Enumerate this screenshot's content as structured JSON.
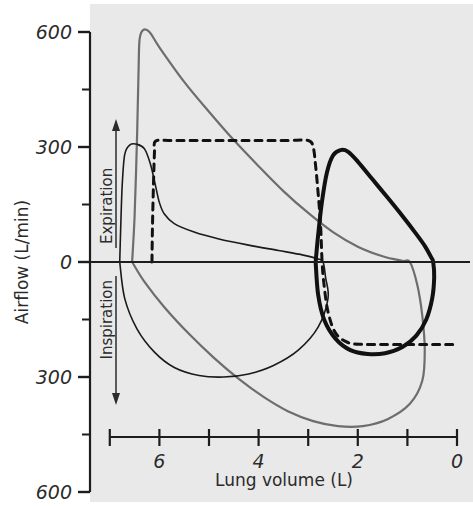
{
  "figure": {
    "background": "#ffffff",
    "plot_background": "#e9e9e9"
  },
  "axes": {
    "x_title": "Lung volume (L)",
    "y_title": "Airflow (L/min)",
    "x_ticks": [
      "7",
      "6",
      "5",
      "4",
      "3",
      "2",
      "1",
      "0"
    ],
    "x_tick_labels_shown": [
      "6",
      "4",
      "2",
      "0"
    ],
    "y_tick_labels_shown": [
      "600",
      "300",
      "0",
      "300",
      "600"
    ],
    "direction_up": "Expiration",
    "direction_down": "Inspiration"
  },
  "colors": {
    "maximal_loop": "#6d6d6d",
    "obstructed_loop": "#1a1a1a",
    "tidal_loop": "#111111",
    "dashed_loop": "#111111",
    "axis": "#1d1d1d"
  },
  "chart_data": {
    "type": "line",
    "title": "",
    "subtitle": "",
    "xlabel": "Lung volume (L)",
    "ylabel": "Airflow (L/min)",
    "xlim": [
      7,
      0
    ],
    "ylim": [
      -600,
      600
    ],
    "x_ticks": [
      7,
      6,
      5,
      4,
      3,
      2,
      1,
      0
    ],
    "y_ticks": [
      -600,
      -450,
      -300,
      -150,
      0,
      150,
      300,
      450,
      600
    ],
    "y_tick_labels": [
      "600",
      "",
      "300",
      "",
      "0",
      "",
      "300",
      "",
      "600"
    ],
    "grid": false,
    "legend": "none",
    "annotations": [
      {
        "text": "Expiration",
        "direction": "up",
        "axis": "y"
      },
      {
        "text": "Inspiration",
        "direction": "down",
        "axis": "y"
      }
    ],
    "note": "Flow-volume loops. X axis is reversed (lung volume decreases left to right).",
    "series": [
      {
        "name": "Maximal flow-volume loop (normal, grey)",
        "color": "#6d6d6d",
        "style": "solid",
        "width": 2.2,
        "points": [
          [
            6.55,
            0
          ],
          [
            6.5,
            120
          ],
          [
            6.45,
            330
          ],
          [
            6.42,
            500
          ],
          [
            6.4,
            580
          ],
          [
            6.33,
            605
          ],
          [
            6.2,
            600
          ],
          [
            6.0,
            560
          ],
          [
            5.5,
            470
          ],
          [
            5.0,
            392
          ],
          [
            4.5,
            318
          ],
          [
            4.0,
            250
          ],
          [
            3.5,
            185
          ],
          [
            3.0,
            128
          ],
          [
            2.5,
            78
          ],
          [
            2.0,
            40
          ],
          [
            1.5,
            15
          ],
          [
            1.1,
            3
          ],
          [
            0.95,
            0
          ],
          [
            0.8,
            -60
          ],
          [
            0.7,
            -140
          ],
          [
            0.65,
            -230
          ],
          [
            0.7,
            -310
          ],
          [
            0.95,
            -370
          ],
          [
            1.4,
            -410
          ],
          [
            1.9,
            -428
          ],
          [
            2.4,
            -428
          ],
          [
            2.9,
            -415
          ],
          [
            3.4,
            -390
          ],
          [
            3.9,
            -352
          ],
          [
            4.4,
            -305
          ],
          [
            4.9,
            -250
          ],
          [
            5.4,
            -188
          ],
          [
            5.9,
            -118
          ],
          [
            6.3,
            -52
          ],
          [
            6.55,
            0
          ]
        ]
      },
      {
        "name": "Obstructive expiratory loop (thin black)",
        "color": "#1a1a1a",
        "style": "solid",
        "width": 1.6,
        "points": [
          [
            6.8,
            0
          ],
          [
            6.78,
            90
          ],
          [
            6.75,
            200
          ],
          [
            6.7,
            280
          ],
          [
            6.6,
            305
          ],
          [
            6.45,
            307
          ],
          [
            6.3,
            295
          ],
          [
            6.18,
            255
          ],
          [
            6.08,
            200
          ],
          [
            6.0,
            155
          ],
          [
            5.9,
            125
          ],
          [
            5.7,
            100
          ],
          [
            5.3,
            78
          ],
          [
            4.8,
            60
          ],
          [
            4.2,
            44
          ],
          [
            3.6,
            30
          ],
          [
            3.1,
            18
          ],
          [
            2.8,
            8
          ],
          [
            2.7,
            0
          ],
          [
            2.65,
            -40
          ],
          [
            2.6,
            -95
          ],
          [
            2.8,
            -170
          ],
          [
            3.2,
            -230
          ],
          [
            3.7,
            -270
          ],
          [
            4.2,
            -292
          ],
          [
            4.7,
            -300
          ],
          [
            5.2,
            -296
          ],
          [
            5.7,
            -275
          ],
          [
            6.1,
            -235
          ],
          [
            6.45,
            -175
          ],
          [
            6.7,
            -95
          ],
          [
            6.8,
            0
          ]
        ]
      },
      {
        "name": "Tidal loop at low lung volume (thick black)",
        "color": "#111111",
        "style": "solid",
        "width": 4.0,
        "points": [
          [
            2.85,
            0
          ],
          [
            2.8,
            70
          ],
          [
            2.72,
            160
          ],
          [
            2.62,
            235
          ],
          [
            2.5,
            278
          ],
          [
            2.35,
            292
          ],
          [
            2.2,
            288
          ],
          [
            2.0,
            262
          ],
          [
            1.7,
            215
          ],
          [
            1.4,
            168
          ],
          [
            1.1,
            120
          ],
          [
            0.85,
            78
          ],
          [
            0.65,
            42
          ],
          [
            0.52,
            12
          ],
          [
            0.48,
            0
          ],
          [
            0.46,
            -40
          ],
          [
            0.5,
            -95
          ],
          [
            0.62,
            -150
          ],
          [
            0.82,
            -192
          ],
          [
            1.1,
            -222
          ],
          [
            1.45,
            -238
          ],
          [
            1.8,
            -240
          ],
          [
            2.15,
            -230
          ],
          [
            2.45,
            -200
          ],
          [
            2.68,
            -150
          ],
          [
            2.8,
            -85
          ],
          [
            2.85,
            0
          ]
        ]
      },
      {
        "name": "Tidal loop at normal lung volume (dashed)",
        "color": "#111111",
        "style": "dashed",
        "width": 3.0,
        "points": [
          [
            6.15,
            0
          ],
          [
            6.14,
            90
          ],
          [
            6.12,
            200
          ],
          [
            6.1,
            285
          ],
          [
            6.08,
            315
          ],
          [
            5.8,
            317
          ],
          [
            5.2,
            317
          ],
          [
            4.6,
            317
          ],
          [
            4.0,
            317
          ],
          [
            3.4,
            317
          ],
          [
            3.0,
            317
          ],
          [
            2.9,
            300
          ],
          [
            2.85,
            250
          ],
          [
            2.8,
            180
          ],
          [
            2.75,
            95
          ],
          [
            2.72,
            0
          ],
          [
            2.68,
            -60
          ],
          [
            2.6,
            -130
          ],
          [
            2.45,
            -185
          ],
          [
            2.2,
            -210
          ],
          [
            1.9,
            -215
          ],
          [
            1.5,
            -215
          ],
          [
            1.0,
            -215
          ],
          [
            0.5,
            -215
          ],
          [
            0.0,
            -215
          ]
        ]
      }
    ]
  }
}
